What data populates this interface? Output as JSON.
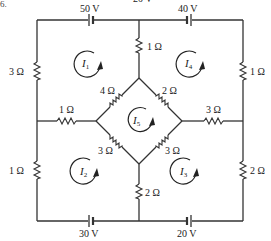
{
  "figure": {
    "number_fragment": "6.",
    "top_cut_label": "20 V"
  },
  "sources": [
    {
      "id": "src-top-left",
      "label": "50 V",
      "x": 91,
      "y": 20,
      "label_x": 84,
      "label_y": 12
    },
    {
      "id": "src-top-right",
      "label": "40 V",
      "x": 189,
      "y": 20,
      "label_x": 182,
      "label_y": 12
    },
    {
      "id": "src-bottom-left",
      "label": "30 V",
      "x": 91,
      "y": 221,
      "label_x": 84,
      "label_y": 236
    },
    {
      "id": "src-bottom-right",
      "label": "20 V",
      "x": 189,
      "y": 221,
      "label_x": 182,
      "label_y": 236
    }
  ],
  "resistors": [
    {
      "id": "r-left-top",
      "label": "3 Ω",
      "value_ohms": 3
    },
    {
      "id": "r-left-bottom",
      "label": "1 Ω",
      "value_ohms": 1
    },
    {
      "id": "r-right-top",
      "label": "1 Ω",
      "value_ohms": 1
    },
    {
      "id": "r-right-bottom",
      "label": "2 Ω",
      "value_ohms": 2
    },
    {
      "id": "r-center-top",
      "label": "1 Ω",
      "value_ohms": 1
    },
    {
      "id": "r-center-bottom",
      "label": "2 Ω",
      "value_ohms": 2
    },
    {
      "id": "r-mid-left",
      "label": "1 Ω",
      "value_ohms": 1
    },
    {
      "id": "r-mid-right",
      "label": "3 Ω",
      "value_ohms": 3
    },
    {
      "id": "r-diamond-ul",
      "label": "4 Ω",
      "value_ohms": 4
    },
    {
      "id": "r-diamond-ur",
      "label": "2 Ω",
      "value_ohms": 2
    },
    {
      "id": "r-diamond-ll",
      "label": "3 Ω",
      "value_ohms": 3
    },
    {
      "id": "r-diamond-lr",
      "label": "3 Ω",
      "value_ohms": 3
    }
  ],
  "loops": [
    {
      "id": "I1",
      "symbol": "I",
      "subscript": "1",
      "direction": "clockwise"
    },
    {
      "id": "I2",
      "symbol": "I",
      "subscript": "2",
      "direction": "clockwise"
    },
    {
      "id": "I3",
      "symbol": "I",
      "subscript": "3",
      "direction": "clockwise"
    },
    {
      "id": "I4",
      "symbol": "I",
      "subscript": "4",
      "direction": "clockwise"
    },
    {
      "id": "I5",
      "symbol": "I",
      "subscript": "5",
      "direction": "clockwise"
    }
  ],
  "colors": {
    "wire": "#333333",
    "text": "#222222",
    "background": "#ffffff"
  }
}
